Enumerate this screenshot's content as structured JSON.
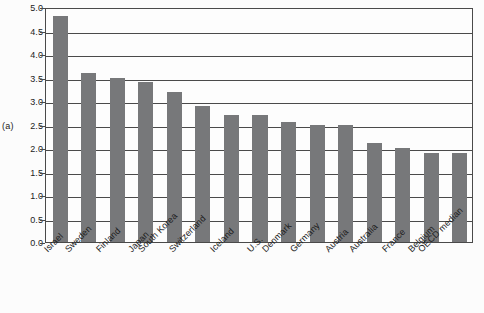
{
  "figure": {
    "axis_group_label": "(a)",
    "bar_color": "#77787a",
    "axis_color": "#4a4a4a",
    "background_color": "#fcfcfc"
  },
  "chart_data": {
    "type": "bar",
    "title": "",
    "xlabel": "",
    "ylabel": "",
    "ylim": [
      0.0,
      5.0
    ],
    "ytick_values": [
      0.0,
      0.5,
      1.0,
      1.5,
      2.0,
      2.5,
      3.0,
      3.5,
      4.0,
      4.5,
      5.0
    ],
    "ytick_labels": [
      "0.0",
      "0.5",
      "1.0",
      "1.5",
      "2.0",
      "2.5",
      "3.0",
      "3.5",
      "4.0",
      "4.5",
      "5.0"
    ],
    "grid": true,
    "legend": false,
    "categories": [
      "Israel",
      "Sweden",
      "Finland",
      "Japan",
      "South Korea",
      "Switzerland",
      "Iceland",
      "U.S.",
      "Denmark",
      "Germany",
      "Austria",
      "Australia",
      "France",
      "Belgium",
      "OECD median"
    ],
    "values": [
      4.8,
      3.6,
      3.5,
      3.4,
      3.2,
      2.9,
      2.7,
      2.7,
      2.55,
      2.5,
      2.5,
      2.1,
      2.0,
      1.9,
      1.9
    ]
  }
}
